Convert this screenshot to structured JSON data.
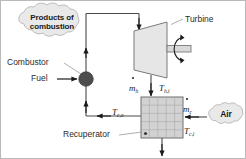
{
  "diagram": {
    "components": {
      "turbine": {
        "label": "Turbine",
        "shape": "trapezoid",
        "fill": "#e6e6e6"
      },
      "combustor": {
        "label": "Combustor",
        "shape": "filled-circle",
        "fill": "#4d4d4d"
      },
      "recuperator": {
        "label": "Recuperator",
        "shape": "grid-box",
        "fill": "#d2d2d2"
      },
      "fuel": {
        "label": "Fuel"
      },
      "shaft": {
        "label": "",
        "rotation_icon": "rotation-arrow-icon"
      }
    },
    "clouds": [
      {
        "name": "products-of-combustion",
        "line1": "Products of",
        "line2": "combustion"
      },
      {
        "name": "air",
        "line1": "Air",
        "line2": ""
      }
    ],
    "stream_labels": {
      "m_hot": {
        "symbol": "m",
        "subscript": "h",
        "dot": true
      },
      "T_hot_in": {
        "symbol": "T",
        "subscript": "h,i",
        "dot": false
      },
      "m_cold": {
        "symbol": "m",
        "subscript": "c",
        "dot": true
      },
      "T_cold_in": {
        "symbol": "T",
        "subscript": "c,i",
        "dot": false
      },
      "T_cold_out": {
        "symbol": "T",
        "subscript": "c,o",
        "dot": false
      }
    },
    "colors": {
      "line": "#4a4a4a",
      "arrow": "#1a1a1a",
      "turbine_fill": "#e6e6e6",
      "turbine_stroke": "#7a7a7a",
      "recuperator_fill": "#d2d2d2",
      "recuperator_grid": "#a8a8a8",
      "recuperator_stroke": "#6e6e6e",
      "combustor_fill": "#4d4d4d",
      "cloud_fill": "#e9e9e9",
      "cloud_stroke": "#bdbdbd",
      "text": "#2b2b2b",
      "border": "#b9b9b9"
    }
  }
}
